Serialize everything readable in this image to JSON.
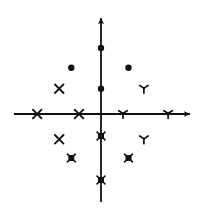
{
  "figure": {
    "title": "",
    "background_color": "#ffffff",
    "ink_color": "#111111"
  },
  "axes": {
    "x_axis_label": "",
    "y_axis_label": "",
    "origin_px": {
      "x": 101,
      "y": 114
    },
    "unit_px": 22,
    "x_axis": {
      "name": "horizontal-axis",
      "start_px": {
        "x": 14,
        "y": 114
      },
      "end_px": {
        "x": 192,
        "y": 114
      },
      "arrow_end": "right"
    },
    "y_axis": {
      "name": "vertical-axis",
      "start_px": {
        "x": 101,
        "y": 202
      },
      "end_px": {
        "x": 101,
        "y": 16
      },
      "arrow_end": "top"
    },
    "line_width": 1.8,
    "grid": false,
    "tick_labels": [],
    "legend": null
  },
  "chart_data": {
    "type": "scatter",
    "title": "",
    "xlabel": "",
    "ylabel": "",
    "xlim": [
      -4,
      4.2
    ],
    "ylim": [
      -4.5,
      4.5
    ],
    "grid": false,
    "legend_position": "none",
    "series": [
      {
        "name": "filled-circle-group",
        "marker": "filled-circle",
        "marker_glyph": "●",
        "color": "#111111",
        "points": [
          {
            "x": 0,
            "y": 3
          },
          {
            "x": 0,
            "y": 1.15
          },
          {
            "x": -1.35,
            "y": 2.1
          },
          {
            "x": 1.25,
            "y": 2.1
          }
        ]
      },
      {
        "name": "x-mark-group",
        "marker": "x-cross",
        "marker_glyph": "✖",
        "color": "#111111",
        "points": [
          {
            "x": -2.9,
            "y": 0
          },
          {
            "x": -1.0,
            "y": 0
          },
          {
            "x": -1.9,
            "y": 1.15
          },
          {
            "x": -1.9,
            "y": -1.15
          }
        ]
      },
      {
        "name": "tri-radiant-group",
        "marker": "tri-radiant",
        "marker_glyph": "⊥",
        "color": "#111111",
        "points": [
          {
            "x": 1.0,
            "y": 0
          },
          {
            "x": 3.05,
            "y": 0
          },
          {
            "x": 1.95,
            "y": 1.15
          },
          {
            "x": 1.95,
            "y": -1.15
          }
        ]
      },
      {
        "name": "filled-square-group",
        "marker": "filled-square",
        "marker_glyph": "■",
        "color": "#111111",
        "points": [
          {
            "x": 0,
            "y": -1.0
          },
          {
            "x": 0,
            "y": -3.0
          },
          {
            "x": -1.35,
            "y": -2.0
          },
          {
            "x": 1.25,
            "y": -2.0
          }
        ]
      }
    ]
  }
}
